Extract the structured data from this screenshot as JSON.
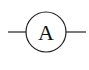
{
  "diagram": {
    "type": "circuit-symbol",
    "symbol": "ammeter",
    "label": "A",
    "colors": {
      "stroke": "#222222",
      "background": "#ffffff"
    }
  }
}
